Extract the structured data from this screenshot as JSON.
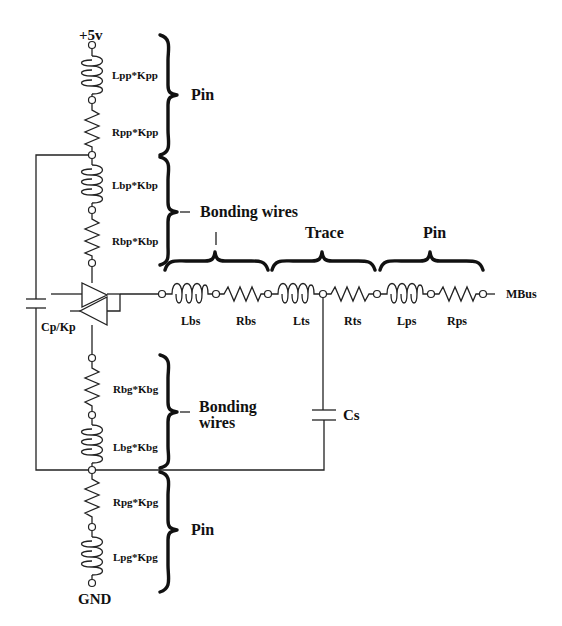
{
  "diagram": {
    "type": "circuit-schematic",
    "supply": {
      "top_label": "+5v",
      "bottom_label": "GND"
    },
    "power_path": {
      "pin_group_label": "Pin",
      "bonding_group_label": "Bonding wires",
      "components": [
        {
          "id": "Lpp",
          "kind": "inductor",
          "label": "Lpp*Kpp"
        },
        {
          "id": "Rpp",
          "kind": "resistor",
          "label": "Rpp*Kpp"
        },
        {
          "id": "Lbp",
          "kind": "inductor",
          "label": "Lbp*Kbp"
        },
        {
          "id": "Rbp",
          "kind": "resistor",
          "label": "Rbp*Kbp"
        }
      ]
    },
    "ground_path": {
      "bonding_group_label_line1": "Bonding",
      "bonding_group_label_line2": "wires",
      "pin_group_label": "Pin",
      "components": [
        {
          "id": "Rbg",
          "kind": "resistor",
          "label": "Rbg*Kbg"
        },
        {
          "id": "Lbg",
          "kind": "inductor",
          "label": "Lbg*Kbg"
        },
        {
          "id": "Rpg",
          "kind": "resistor",
          "label": "Rpg*Kpg"
        },
        {
          "id": "Lpg",
          "kind": "inductor",
          "label": "Lpg*Kpg"
        }
      ]
    },
    "decoupling": {
      "label": "Cp/Kp",
      "kind": "capacitor"
    },
    "driver": {
      "kind": "bidirectional-buffer"
    },
    "signal_path": {
      "groups": [
        {
          "label": "",
          "covers": [
            "Lbs",
            "Rbs"
          ]
        },
        {
          "label": "Trace",
          "covers": [
            "Lts",
            "Rts"
          ]
        },
        {
          "label": "Pin",
          "covers": [
            "Lps",
            "Rps"
          ]
        }
      ],
      "components": [
        {
          "id": "Lbs",
          "kind": "inductor",
          "label": "Lbs"
        },
        {
          "id": "Rbs",
          "kind": "resistor",
          "label": "Rbs"
        },
        {
          "id": "Lts",
          "kind": "inductor",
          "label": "Lts"
        },
        {
          "id": "Rts",
          "kind": "resistor",
          "label": "Rts"
        },
        {
          "id": "Lps",
          "kind": "inductor",
          "label": "Lps"
        },
        {
          "id": "Rps",
          "kind": "resistor",
          "label": "Rps"
        }
      ],
      "output_label": "MBus"
    },
    "trace_capacitor": {
      "label": "Cs",
      "kind": "capacitor"
    }
  }
}
